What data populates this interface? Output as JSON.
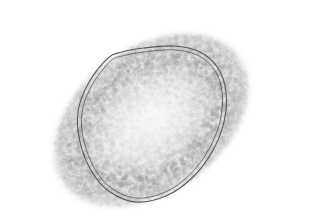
{
  "image": {
    "kind": "transmission-electron-micrograph",
    "subject": "ovoid enveloped virus particle",
    "alt_text": "Grayscale transmission electron micrograph of an ovoid virus particle with a dark double-layered membrane outline, granular filamentous interior, and diffuse fuzzy halo, on a plain white background",
    "width_px": 222,
    "height_px": 206,
    "background_color": "#ffffff",
    "rendering": "grayscale",
    "has_scale_bar": false,
    "has_text_annotation": false,
    "colors": {
      "background": "#ffffff",
      "halo_gray": "#b9b9b9",
      "body_gray": "#9a9a9a",
      "interior_light": "#ededed",
      "membrane_dark": "#4a4a4a",
      "dense_knot": "#2e2e2e"
    },
    "particle": {
      "center_x": 111,
      "center_y": 104,
      "major_axis_px": 178,
      "minor_axis_px": 120,
      "tilt_degrees": -36,
      "outline_shape": "lenticular-ovoid"
    },
    "membrane": {
      "layer_count": 2,
      "layer_gap_px": 4,
      "stroke_width_px": 1.1,
      "stroke_color": "#4a4a4a",
      "path_points": [
        [
          68,
          42
        ],
        [
          48,
          68
        ],
        [
          38,
          96
        ],
        [
          40,
          126
        ],
        [
          52,
          156
        ],
        [
          70,
          176
        ],
        [
          96,
          186
        ],
        [
          126,
          180
        ],
        [
          152,
          162
        ],
        [
          172,
          136
        ],
        [
          184,
          106
        ],
        [
          186,
          76
        ],
        [
          178,
          52
        ],
        [
          160,
          36
        ],
        [
          134,
          30
        ],
        [
          104,
          32
        ],
        [
          82,
          36
        ]
      ]
    },
    "dense_regions": [
      {
        "name": "upper-right-knot",
        "cx": 180,
        "cy": 44,
        "rx": 26,
        "ry": 22,
        "darkness": 0.82
      },
      {
        "name": "lower-left-knot",
        "cx": 66,
        "cy": 182,
        "rx": 20,
        "ry": 15,
        "darkness": 0.78
      },
      {
        "name": "lower-center-mass",
        "cx": 104,
        "cy": 160,
        "rx": 42,
        "ry": 26,
        "darkness": 0.42
      },
      {
        "name": "right-flank",
        "cx": 170,
        "cy": 112,
        "rx": 30,
        "ry": 44,
        "darkness": 0.38
      }
    ],
    "texture": {
      "grain_density": 5200,
      "filament_count": 900,
      "grain_radius_px": 1.6,
      "seed": 20240117
    }
  }
}
